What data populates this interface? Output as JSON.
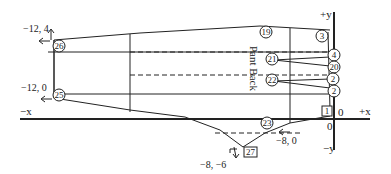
{
  "diagram": {
    "title": "Pant Back",
    "axes": {
      "neg_x": "−x",
      "pos_x": "+x",
      "pos_y": "+y",
      "neg_y": "−y",
      "origin_x_label": "0",
      "origin_y_label": "0"
    },
    "coordinates": {
      "top_left": "−12, 4",
      "mid_left": "−12, 0",
      "bottom_right": "−8, 0",
      "bottom_point": "−8, −6"
    },
    "circled_points": {
      "p26": "26",
      "p25": "25",
      "p19": "19",
      "p3": "3",
      "p21": "21",
      "p22": "22",
      "p23": "23",
      "p4": "4",
      "p20": "20",
      "p2a": "2",
      "p2b": "2"
    },
    "boxed_points": {
      "b1": "1",
      "b27": "27"
    },
    "colors": {
      "line": "#222222",
      "background": "#ffffff"
    }
  }
}
